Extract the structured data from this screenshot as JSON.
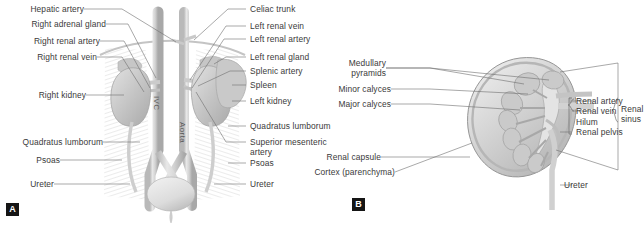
{
  "figure": {
    "panels": [
      {
        "id": "A",
        "badge": "A",
        "title": "Retroperitoneal anatomy of the kidneys and great vessels",
        "left_labels": [
          {
            "name": "hepatic-artery",
            "text": "Hepatic artery"
          },
          {
            "name": "right-adrenal-gland",
            "text": "Right adrenal gland"
          },
          {
            "name": "right-renal-artery",
            "text": "Right renal artery"
          },
          {
            "name": "right-renal-vein",
            "text": "Right renal vein"
          },
          {
            "name": "right-kidney",
            "text": "Right kidney"
          },
          {
            "name": "quadratus-lumborum-left",
            "text": "Quadratus lumborum"
          },
          {
            "name": "psoas-left",
            "text": "Psoas"
          },
          {
            "name": "ureter-left",
            "text": "Ureter"
          }
        ],
        "right_labels": [
          {
            "name": "celiac-trunk",
            "text": "Celiac trunk"
          },
          {
            "name": "left-renal-vein",
            "text": "Left renal vein"
          },
          {
            "name": "left-renal-artery",
            "text": "Left renal artery"
          },
          {
            "name": "left-renal-gland",
            "text": "Left renal gland"
          },
          {
            "name": "splenic-artery",
            "text": "Splenic artery"
          },
          {
            "name": "spleen",
            "text": "Spleen"
          },
          {
            "name": "left-kidney",
            "text": "Left kidney"
          },
          {
            "name": "quadratus-lumborum-right",
            "text": "Quadratus lumborum"
          },
          {
            "name": "superior-mesenteric-artery",
            "text": "Superior mesenteric\nartery"
          },
          {
            "name": "psoas-right",
            "text": "Psoas"
          },
          {
            "name": "ureter-right",
            "text": "Ureter"
          }
        ],
        "inline_labels": [
          {
            "name": "ivc",
            "text": "IVC"
          },
          {
            "name": "aorta",
            "text": "Aorta"
          }
        ]
      },
      {
        "id": "B",
        "badge": "B",
        "title": "Coronal section of the kidney",
        "left_labels": [
          {
            "name": "medullary-pyramids",
            "text": "Medullary\npyramids"
          },
          {
            "name": "minor-calyces",
            "text": "Minor calyces"
          },
          {
            "name": "major-calyces",
            "text": "Major calyces"
          },
          {
            "name": "renal-capsule",
            "text": "Renal capsule"
          },
          {
            "name": "cortex-parenchyma",
            "text": "Cortex (parenchyma)"
          }
        ],
        "right_labels": [
          {
            "name": "renal-artery",
            "text": "Renal artery"
          },
          {
            "name": "renal-vein",
            "text": "Renal vein"
          },
          {
            "name": "hilum",
            "text": "Hilum"
          },
          {
            "name": "renal-pelvis",
            "text": "Renal pelvis"
          },
          {
            "name": "renal-sinus",
            "text": "Renal\nsinus"
          },
          {
            "name": "ureter-b",
            "text": "Ureter"
          }
        ]
      }
    ]
  },
  "colors": {
    "label_text": "#3a3a3a",
    "leader_line": "#6e6e6e",
    "badge_background": "#151515",
    "badge_text": "#ffffff",
    "organ_fill": "#cfcfcf",
    "vessel_fill": "#d8d8d8",
    "background": "#ffffff"
  }
}
